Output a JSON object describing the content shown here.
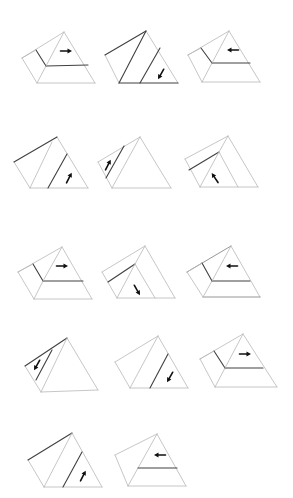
{
  "diagram": {
    "title": "",
    "figure_count": 14,
    "rows": 5,
    "figures": [
      {
        "id": 1,
        "row": 1,
        "col": 1,
        "variant": "wedge-step",
        "arrow": "right"
      },
      {
        "id": 2,
        "row": 1,
        "col": 2,
        "variant": "slice-front",
        "arrow": "down-left"
      },
      {
        "id": 3,
        "row": 1,
        "col": 3,
        "variant": "wedge-step",
        "arrow": "left"
      },
      {
        "id": 4,
        "row": 2,
        "col": 1,
        "variant": "slice-front",
        "arrow": "up-right"
      },
      {
        "id": 5,
        "row": 2,
        "col": 2,
        "variant": "slice-side",
        "arrow": "up-right"
      },
      {
        "id": 6,
        "row": 2,
        "col": 3,
        "variant": "slice-inner",
        "arrow": "up-left"
      },
      {
        "id": 7,
        "row": 3,
        "col": 1,
        "variant": "wedge-step",
        "arrow": "right"
      },
      {
        "id": 8,
        "row": 3,
        "col": 2,
        "variant": "slice-inner",
        "arrow": "down-right"
      },
      {
        "id": 9,
        "row": 3,
        "col": 3,
        "variant": "wedge-step",
        "arrow": "left"
      },
      {
        "id": 10,
        "row": 4,
        "col": 1,
        "variant": "slice-side",
        "arrow": "down-left"
      },
      {
        "id": 11,
        "row": 4,
        "col": 2,
        "variant": "slice-front",
        "arrow": "down-left"
      },
      {
        "id": 12,
        "row": 4,
        "col": 3,
        "variant": "wedge-step",
        "arrow": "right"
      },
      {
        "id": 13,
        "row": 5,
        "col": 1,
        "variant": "slice-front",
        "arrow": "up-right"
      },
      {
        "id": 14,
        "row": 5,
        "col": 2,
        "variant": "horizontal-cut",
        "arrow": "left"
      }
    ],
    "colors": {
      "background": "#ffffff",
      "edge_light": "#b8b8b8",
      "edge_dark": "#404040",
      "arrow": "#111111"
    }
  }
}
